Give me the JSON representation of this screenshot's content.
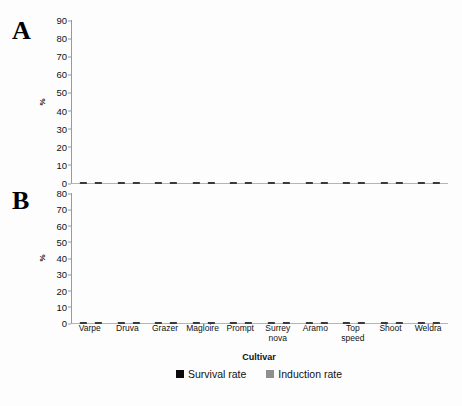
{
  "figure": {
    "panel_a_letter": "A",
    "panel_b_letter": "B",
    "xaxis_title": "Cultivar"
  },
  "legend": {
    "position": "bottom-center",
    "items": [
      {
        "label": "Survival rate",
        "color": "#0b0b0b",
        "key": "survival"
      },
      {
        "label": "Induction rate",
        "color": "#8f8f8f",
        "key": "induction"
      }
    ]
  },
  "chart_data": [
    {
      "type": "bar",
      "panel": "A",
      "title": "A",
      "xlabel": "Cultivar",
      "ylabel": "%",
      "ylim": [
        0,
        90
      ],
      "yticks": [
        0,
        10,
        20,
        30,
        40,
        50,
        60,
        70,
        80,
        90
      ],
      "grid": false,
      "categories": [
        "Varpe",
        "Druva",
        "Grazer",
        "Magloire",
        "Prompt",
        "Surrey nova",
        "Aramo",
        "Top speed",
        "Shoot",
        "Weldra"
      ],
      "series": [
        {
          "name": "Survival rate",
          "color": "#0b0b0b",
          "values": [
            27,
            41,
            63,
            53,
            38,
            44,
            47,
            48.5,
            49,
            39.5
          ],
          "errors": [
            1.5,
            8.5,
            4,
            1.5,
            3,
            3,
            2.5,
            2,
            2.5,
            3.5
          ]
        },
        {
          "name": "Induction rate",
          "color": "#8f8f8f",
          "values": [
            54.5,
            69,
            62,
            65,
            75,
            62,
            61.5,
            51,
            54,
            45
          ],
          "errors": [
            2,
            2.5,
            5,
            2,
            6,
            3,
            2,
            2,
            3.5,
            1.5
          ]
        }
      ]
    },
    {
      "type": "bar",
      "panel": "B",
      "title": "B",
      "xlabel": "Cultivar",
      "ylabel": "%",
      "ylim": [
        0,
        80
      ],
      "yticks": [
        0,
        10,
        20,
        30,
        40,
        50,
        60,
        70,
        80
      ],
      "grid": false,
      "categories": [
        "Varpe",
        "Druva",
        "Grazer",
        "Magloire",
        "Prompt",
        "Surrey nova",
        "Aramo",
        "Top speed",
        "Shoot",
        "Weldra"
      ],
      "series": [
        {
          "name": "Survival rate",
          "color": "#0b0b0b",
          "values": [
            26,
            41.5,
            33.5,
            56,
            43,
            35,
            40,
            36,
            55,
            48
          ],
          "errors": [
            3,
            3.5,
            2,
            2,
            2.5,
            2,
            1.5,
            3,
            4,
            1.5
          ]
        },
        {
          "name": "Induction rate",
          "color": "#8f8f8f",
          "values": [
            53,
            43,
            56.5,
            64,
            72,
            73,
            70,
            53,
            71,
            63
          ],
          "errors": [
            3.5,
            2,
            3,
            1.5,
            3,
            6,
            3,
            2.5,
            4,
            3
          ]
        }
      ]
    }
  ],
  "xtick_labels": [
    "Varpe",
    "Druva",
    "Grazer",
    "Magloire",
    "Prompt",
    "Surrey\nnova",
    "Aramo",
    "Top\nspeed",
    "Shoot",
    "Weldra"
  ]
}
